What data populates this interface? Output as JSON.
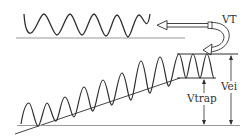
{
  "diagram": {
    "type": "waveform-threshold-diagram",
    "colors": {
      "stroke": "#2e2e2e",
      "baseline": "#9a9a9a",
      "background": "#ffffff"
    },
    "labels": {
      "vt": "VT",
      "vei": "Vei",
      "vtrap": "Vtrap"
    },
    "top_waveform": {
      "description": "periodic sine wave above a baseline",
      "cycles": 5.5
    },
    "bottom_waveform": {
      "description": "oscillating wave riding on a rising sloped trend line, saturating between two horizontal levels",
      "levels": [
        "upper level (VT)",
        "lower level (Vtrap)"
      ]
    },
    "arrows": [
      {
        "name": "output-arrow",
        "direction": "left",
        "description": "double-line arrow pointing to top waveform"
      },
      {
        "name": "feedback-curve-arrow",
        "direction": "curved down-left",
        "description": "curved arrow linking VT level to lower waveform upper level"
      },
      {
        "name": "vtrap-dimension",
        "direction": "vertical double",
        "description": "spans lower level to baseline"
      },
      {
        "name": "vei-dimension",
        "direction": "vertical double",
        "description": "spans upper level to baseline"
      }
    ]
  }
}
